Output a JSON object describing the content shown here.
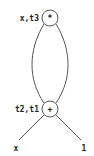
{
  "diagram": {
    "nodes": [
      {
        "id": "top",
        "op": "*",
        "label": "x,t3"
      },
      {
        "id": "bottom",
        "op": "+",
        "label": "t2,t1"
      }
    ],
    "leaves": [
      {
        "id": "leaf-x",
        "label": "x"
      },
      {
        "id": "leaf-1",
        "label": "1"
      }
    ],
    "colors": {
      "stroke": "#555555",
      "text": "#222222",
      "background": "#ffffff"
    }
  }
}
